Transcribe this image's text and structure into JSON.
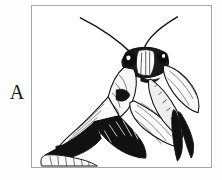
{
  "figure": {
    "panel_label": "A",
    "caption_text": "",
    "frame": {
      "border_color": "#a6a6a6",
      "background_color": "#ffffff",
      "x": 31,
      "y": 5,
      "width": 181,
      "height": 163
    },
    "illustration": {
      "subject": "praying mantis",
      "style": "black-and-white pen-and-ink line drawing",
      "ink_color": "#111111",
      "paper_color": "#ffffff",
      "orientation": "facing right, body angled diagonally from lower-left to upper-right",
      "parts": [
        "antenna-left",
        "antenna-right",
        "head",
        "compound-eye-left",
        "compound-eye-right",
        "face-stripes",
        "pronotum",
        "thorax",
        "abdomen",
        "wing",
        "raptorial-foreleg-near",
        "raptorial-foreleg-far",
        "midleg",
        "hindleg",
        "tarsus"
      ]
    }
  },
  "page": {
    "background_color": "#ffffff",
    "width": 222,
    "height": 180
  }
}
